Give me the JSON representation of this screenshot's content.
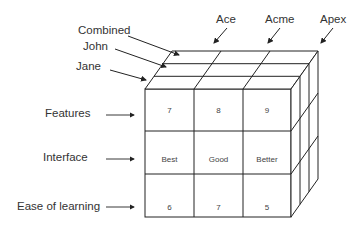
{
  "diagram": {
    "type": "data-cube",
    "depth_labels": [
      "Combined",
      "John",
      "Jane"
    ],
    "column_labels": [
      "Ace",
      "Acme",
      "Apex"
    ],
    "row_labels": [
      "Features",
      "Interface",
      "Ease of learning"
    ],
    "front_face": {
      "label": "Jane",
      "rows": [
        [
          "7",
          "8",
          "9"
        ],
        [
          "Best",
          "Good",
          "Better"
        ],
        [
          "6",
          "7",
          "5"
        ]
      ]
    }
  }
}
